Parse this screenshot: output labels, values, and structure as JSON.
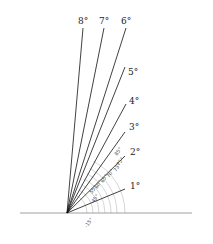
{
  "diagram": {
    "origin": {
      "x": 67,
      "y": 213
    },
    "baseline": {
      "x1": 20,
      "x2": 192,
      "y": 213,
      "color": "#888888"
    },
    "rays": [
      {
        "label": "8°",
        "x2": 83,
        "y2": 28,
        "lx": 78,
        "ly": 24
      },
      {
        "label": "7°",
        "x2": 104,
        "y2": 28,
        "lx": 99,
        "ly": 24
      },
      {
        "label": "6°",
        "x2": 126,
        "y2": 28,
        "lx": 121,
        "ly": 24
      },
      {
        "label": "5°",
        "x2": 125,
        "y2": 67,
        "lx": 128,
        "ly": 75
      },
      {
        "label": "4°",
        "x2": 126,
        "y2": 104,
        "lx": 129,
        "ly": 104
      },
      {
        "label": "3°",
        "x2": 125,
        "y2": 132,
        "lx": 129,
        "ly": 130
      },
      {
        "label": "2°",
        "x2": 125,
        "y2": 156,
        "lx": 130,
        "ly": 155
      },
      {
        "label": "1°",
        "x2": 125,
        "y2": 189,
        "lx": 130,
        "ly": 189
      }
    ],
    "angle_labels": [
      {
        "text": "85°",
        "x": 117,
        "y": 156
      },
      {
        "text": "75°",
        "x": 119,
        "y": 166
      },
      {
        "text": "73°",
        "x": 116,
        "y": 172
      },
      {
        "text": "70°",
        "x": 109,
        "y": 178
      },
      {
        "text": "65°",
        "x": 103,
        "y": 183
      },
      {
        "text": "60°",
        "x": 97,
        "y": 189
      },
      {
        "text": "55°",
        "x": 92,
        "y": 194
      },
      {
        "text": "45°",
        "x": 94,
        "y": 203
      },
      {
        "text": "-15°",
        "x": 87,
        "y": 228
      }
    ],
    "arcs": [
      20,
      26,
      32,
      38,
      44,
      50,
      58
    ],
    "line_color": "#111111",
    "arc_color": "#bbbbbb"
  }
}
